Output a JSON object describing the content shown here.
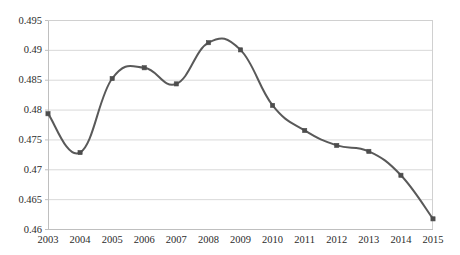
{
  "chart_data": {
    "type": "line",
    "title": "",
    "subtitle": "",
    "xlabel": "",
    "ylabel": "",
    "x": [
      2003,
      2004,
      2005,
      2006,
      2007,
      2008,
      2009,
      2010,
      2011,
      2012,
      2013,
      2014,
      2015
    ],
    "categories": [
      "2003",
      "2004",
      "2005",
      "2006",
      "2007",
      "2008",
      "2009",
      "2010",
      "2011",
      "2012",
      "2013",
      "2014",
      "2015"
    ],
    "values": [
      0.4793,
      0.4728,
      0.4852,
      0.487,
      0.4843,
      0.4912,
      0.49,
      0.4807,
      0.4765,
      0.474,
      0.473,
      0.469,
      0.4617
    ],
    "series": [
      {
        "name": "series-1",
        "values": [
          0.4793,
          0.4728,
          0.4852,
          0.487,
          0.4843,
          0.4912,
          0.49,
          0.4807,
          0.4765,
          0.474,
          0.473,
          0.469,
          0.4617
        ],
        "color": "#595959",
        "marker": "square",
        "smooth": true
      }
    ],
    "ylim": [
      0.46,
      0.495
    ],
    "ytick_values": [
      0.46,
      0.465,
      0.47,
      0.475,
      0.48,
      0.485,
      0.49,
      0.495
    ],
    "ytick_labels": [
      "0.46",
      "0.465",
      "0.47",
      "0.475",
      "0.48",
      "0.485",
      "0.49",
      "0.495"
    ],
    "xtick_labels": [
      "2003",
      "2004",
      "2005",
      "2006",
      "2007",
      "2008",
      "2009",
      "2010",
      "2011",
      "2012",
      "2013",
      "2014",
      "2015"
    ],
    "grid": {
      "horizontal": true,
      "vertical": false,
      "color": "#d9d9d9"
    },
    "legend": {
      "visible": false,
      "position": "none",
      "entries": []
    },
    "annotations": [],
    "plot_area": {
      "left": 48,
      "top": 20,
      "right": 433,
      "bottom": 229
    },
    "colors": {
      "line": "#595959",
      "marker": "#4d4d4d",
      "grid": "#d9d9d9",
      "axis": "#bfbfbf",
      "text": "#2b2b2b",
      "background": "#ffffff"
    }
  }
}
